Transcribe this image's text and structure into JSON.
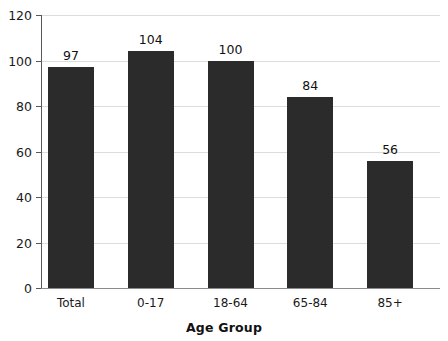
{
  "chart_data": {
    "type": "bar",
    "title": "",
    "subtitle": "",
    "xlabel": "Age Group",
    "ylabel": "",
    "categories": [
      "Total",
      "0-17",
      "18-64",
      "65-84",
      "85+"
    ],
    "values": [
      97,
      104,
      100,
      84,
      56
    ],
    "value_labels": [
      "97",
      "104",
      "100",
      "84",
      "56"
    ],
    "ylim": [
      0,
      120
    ],
    "ytick_labels": [
      "0",
      "20",
      "40",
      "60",
      "80",
      "100",
      "120"
    ],
    "ytick_values": [
      0,
      20,
      40,
      60,
      80,
      100,
      120
    ],
    "grid": "horizontal",
    "legend": "none",
    "bar_color": "#2b2b2b",
    "grid_color": "#dcdcdc",
    "axis_color": "#595959",
    "background_color": "#ffffff",
    "series": [
      {
        "name": "Rate",
        "values": [
          97,
          104,
          100,
          84,
          56
        ]
      }
    ]
  }
}
